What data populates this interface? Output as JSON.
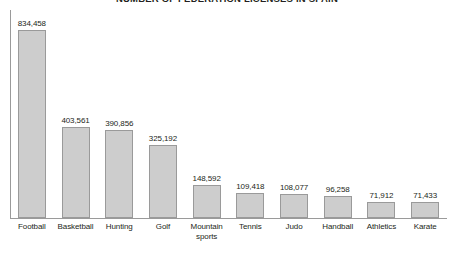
{
  "chart_data": {
    "type": "bar",
    "title": "NUMBER OF FEDERATION LICENSES IN SPAIN",
    "xlabel": "",
    "ylabel": "",
    "ylim": [
      0,
      880000
    ],
    "grid": false,
    "legend": "none",
    "orientation": "vertical",
    "value_labels_shown": true,
    "axis_tick_labels_shown": false,
    "categories": [
      "Football",
      "Basketball",
      "Hunting",
      "Golf",
      "Mountain sports",
      "Tennis",
      "Judo",
      "Handball",
      "Athletics",
      "Karate"
    ],
    "category_lines": [
      [
        "Football"
      ],
      [
        "Basketball"
      ],
      [
        "Hunting"
      ],
      [
        "Golf"
      ],
      [
        "Mountain",
        "sports"
      ],
      [
        "Tennis"
      ],
      [
        "Judo"
      ],
      [
        "Handball"
      ],
      [
        "Athletics"
      ],
      [
        "Karate"
      ]
    ],
    "values": [
      834458,
      403561,
      390856,
      325192,
      148592,
      109418,
      108077,
      96258,
      71912,
      71433
    ],
    "value_labels": [
      "834,458",
      "403,561",
      "390,856",
      "325,192",
      "148,592",
      "109,418",
      "108,077",
      "96,258",
      "71,912",
      "71,433"
    ]
  },
  "style": {
    "bar_fill": "#cdcdcd",
    "bar_stroke": "#9a9a9a",
    "axis_color": "#9a9a9a",
    "text_color": "#231f20",
    "background": "#ffffff"
  }
}
